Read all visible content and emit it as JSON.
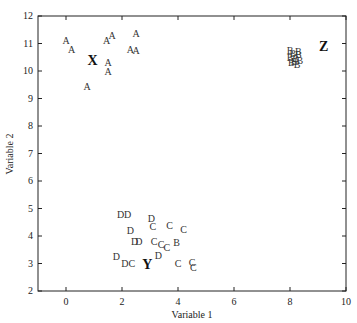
{
  "chart_data": {
    "type": "scatter",
    "title": "",
    "xlabel": "Variable 1",
    "ylabel": "Variable 2",
    "xlim": [
      -1,
      10
    ],
    "ylim": [
      2,
      12
    ],
    "xticks": [
      0,
      2,
      4,
      6,
      8,
      10
    ],
    "yticks": [
      2,
      3,
      4,
      5,
      6,
      7,
      8,
      9,
      10,
      11,
      12
    ],
    "grid": false,
    "legend": "none; points plotted as letter markers",
    "series": [
      {
        "name": "A",
        "points": [
          [
            0.0,
            11.1
          ],
          [
            0.2,
            10.8
          ],
          [
            1.45,
            11.1
          ],
          [
            1.65,
            11.3
          ],
          [
            2.5,
            11.35
          ],
          [
            1.5,
            10.3
          ],
          [
            1.5,
            10.0
          ],
          [
            2.3,
            10.8
          ],
          [
            2.5,
            10.75
          ],
          [
            0.75,
            9.45
          ]
        ]
      },
      {
        "name": "B",
        "points": [
          [
            8.1,
            10.65
          ],
          [
            8.3,
            10.6
          ],
          [
            8.0,
            10.5
          ],
          [
            8.2,
            10.45
          ],
          [
            8.35,
            10.4
          ],
          [
            8.05,
            10.3
          ],
          [
            8.25,
            10.25
          ],
          [
            8.0,
            10.75
          ],
          [
            8.3,
            10.7
          ],
          [
            8.15,
            10.35
          ],
          [
            3.95,
            3.75
          ]
        ]
      },
      {
        "name": "C",
        "points": [
          [
            3.1,
            4.35
          ],
          [
            3.7,
            4.4
          ],
          [
            4.2,
            4.25
          ],
          [
            3.15,
            3.8
          ],
          [
            3.4,
            3.7
          ],
          [
            3.6,
            3.6
          ],
          [
            2.35,
            3.0
          ],
          [
            4.0,
            3.0
          ],
          [
            4.5,
            3.05
          ],
          [
            4.55,
            2.85
          ]
        ]
      },
      {
        "name": "D",
        "points": [
          [
            1.95,
            4.8
          ],
          [
            2.2,
            4.8
          ],
          [
            3.05,
            4.65
          ],
          [
            2.3,
            4.2
          ],
          [
            2.45,
            3.8
          ],
          [
            2.6,
            3.8
          ],
          [
            1.8,
            3.25
          ],
          [
            2.1,
            3.0
          ],
          [
            3.3,
            3.3
          ]
        ]
      }
    ],
    "cluster_labels": [
      {
        "label": "X",
        "x": 0.95,
        "y": 10.4
      },
      {
        "label": "Y",
        "x": 2.9,
        "y": 3.0
      },
      {
        "label": "Z",
        "x": 9.2,
        "y": 10.9
      }
    ]
  }
}
